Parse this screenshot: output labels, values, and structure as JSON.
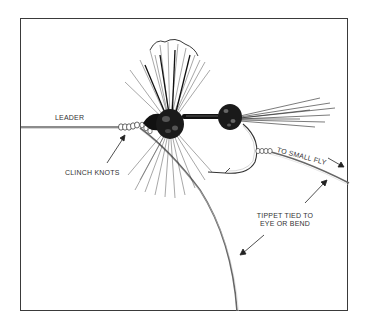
{
  "figure": {
    "labels": {
      "leader": "LEADER",
      "clinch_knots": "CLINCH KNOTS",
      "to_small_fly": "TO SMALL FLY",
      "tippet_line1": "TIPPET TIED TO",
      "tippet_line2": "EYE OR BEND"
    },
    "colors": {
      "ink": "#1a1a1a",
      "line": "#555555",
      "frame": "#3a3a3a",
      "background": "#ffffff"
    }
  }
}
